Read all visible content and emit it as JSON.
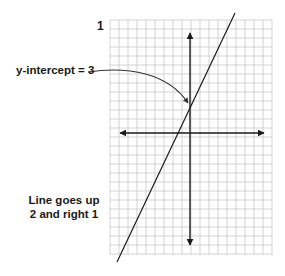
{
  "figure": {
    "panel_label": "1",
    "annotations": {
      "intercept": "y-intercept = 3",
      "slope_line1": "Line goes up",
      "slope_line2": "2 and right 1"
    }
  },
  "graph": {
    "type": "line-on-grid",
    "grid": {
      "x0": 110,
      "y0": 20,
      "x1": 272,
      "y1": 255,
      "spacing": 9,
      "color": "#c8c8c8"
    },
    "axes": {
      "origin_px": [
        190,
        133
      ],
      "x_axis_px": [
        120,
        264
      ],
      "y_axis_px": [
        33,
        245
      ],
      "color": "#222222"
    },
    "line": {
      "slope": 2,
      "y_intercept": 3,
      "from_px": [
        117,
        262
      ],
      "to_px": [
        235,
        13
      ],
      "color": "#222222"
    },
    "callout": {
      "from_px": [
        88,
        72
      ],
      "to_px": [
        188,
        103
      ]
    }
  },
  "chart_data": {
    "type": "line",
    "title": "",
    "equation": "y = 2x + 3",
    "slope": 2,
    "y_intercept": 3,
    "annotations": [
      "y-intercept = 3",
      "Line goes up 2 and right 1"
    ],
    "grid": true
  }
}
